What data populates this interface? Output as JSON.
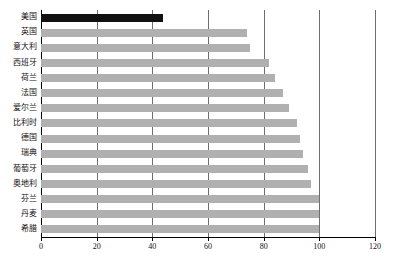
{
  "chart_data": {
    "type": "bar",
    "orientation": "horizontal",
    "title": "",
    "xlabel": "",
    "ylabel": "",
    "xlim": [
      0,
      120
    ],
    "xticks": [
      0,
      20,
      40,
      60,
      80,
      100,
      120
    ],
    "xtick_labels": [
      "0",
      "20",
      "40",
      "60",
      "80",
      "100",
      "120"
    ],
    "grid": true,
    "grid_axis": "x",
    "legend": false,
    "categories": [
      "美国",
      "英国",
      "意大利",
      "西班牙",
      "荷兰",
      "法国",
      "爱尔兰",
      "比利时",
      "德国",
      "瑞典",
      "葡萄牙",
      "奥地利",
      "芬兰",
      "丹麦",
      "希腊"
    ],
    "values": [
      44,
      74,
      75,
      82,
      84,
      87,
      89,
      92,
      93,
      94,
      96,
      97,
      100,
      100,
      100
    ],
    "series": [
      {
        "name": "",
        "values": [
          44,
          74,
          75,
          82,
          84,
          87,
          89,
          92,
          93,
          94,
          96,
          97,
          100,
          100,
          100
        ]
      }
    ],
    "bar_colors": [
      "#111111",
      "#b0b0b0",
      "#b0b0b0",
      "#b0b0b0",
      "#b0b0b0",
      "#b0b0b0",
      "#b0b0b0",
      "#b0b0b0",
      "#b0b0b0",
      "#b0b0b0",
      "#b0b0b0",
      "#b0b0b0",
      "#b0b0b0",
      "#b0b0b0",
      "#b0b0b0"
    ],
    "highlight_category": "美国",
    "colors": {
      "highlight": "#111111",
      "bar": "#b0b0b0",
      "gridline": "#6e6e6e",
      "axis": "#000000",
      "background": "#ffffff",
      "text": "#111111"
    }
  }
}
